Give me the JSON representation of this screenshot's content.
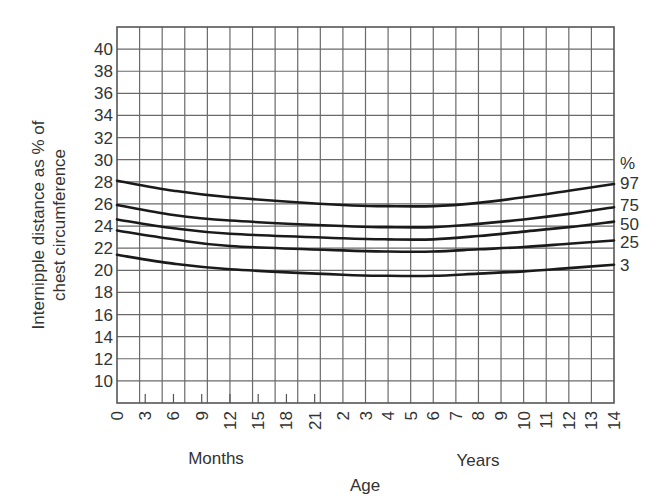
{
  "chart_data": {
    "type": "line",
    "title": "",
    "ylabel_lines": [
      "Internipple distance as % of",
      "chest circumference"
    ],
    "xlabel": "Age",
    "x_group_labels": {
      "months": "Months",
      "years": "Years"
    },
    "legend_title": "%",
    "ylim": [
      8,
      42
    ],
    "y_ticks": [
      10,
      12,
      14,
      16,
      18,
      20,
      22,
      24,
      26,
      28,
      30,
      32,
      34,
      36,
      38,
      40
    ],
    "x_month_ticks": [
      0,
      3,
      6,
      9,
      12,
      15,
      18,
      21
    ],
    "x_year_ticks": [
      2,
      3,
      4,
      5,
      6,
      7,
      8,
      9,
      10,
      11,
      12,
      13,
      14
    ],
    "x_axis_note": "Months scale from 0 to 24 months (2 years), then years scale from 2 to 14",
    "grid": true,
    "legend_position": "right",
    "x_age_years": [
      0,
      0.5,
      1,
      2,
      4,
      6,
      8,
      10,
      12,
      14
    ],
    "series": [
      {
        "name": "97",
        "values": [
          28.1,
          27.2,
          26.6,
          25.9,
          25.8,
          25.8,
          26.1,
          26.6,
          27.2,
          27.8
        ]
      },
      {
        "name": "75",
        "values": [
          25.9,
          25.0,
          24.5,
          24.0,
          23.9,
          23.9,
          24.2,
          24.6,
          25.1,
          25.7
        ]
      },
      {
        "name": "50",
        "values": [
          24.6,
          23.8,
          23.3,
          22.9,
          22.8,
          22.8,
          23.1,
          23.5,
          23.9,
          24.4
        ]
      },
      {
        "name": "25",
        "values": [
          23.6,
          22.8,
          22.2,
          21.8,
          21.7,
          21.7,
          21.9,
          22.1,
          22.4,
          22.7
        ]
      },
      {
        "name": "3",
        "values": [
          21.4,
          20.6,
          20.1,
          19.6,
          19.5,
          19.5,
          19.7,
          19.9,
          20.2,
          20.5
        ]
      }
    ]
  }
}
